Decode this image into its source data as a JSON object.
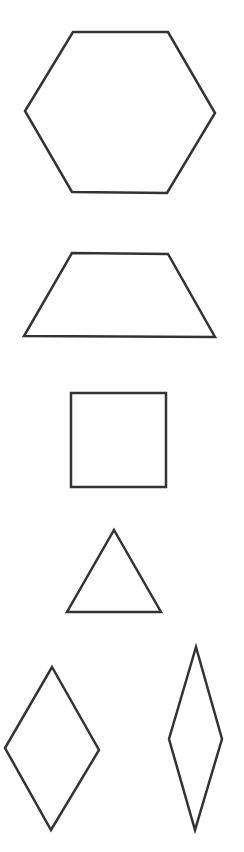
{
  "canvas": {
    "width": 244,
    "height": 852,
    "background": "#ffffff"
  },
  "style": {
    "stroke": "#333333",
    "stroke_width": 2.5,
    "fill": "#ffffff"
  },
  "shapes": [
    {
      "name": "hexagon",
      "points": "73,32 168,32 215,113 167,193 72,192 25,111"
    },
    {
      "name": "trapezoid",
      "points": "72,253 168,254 215,337 24,336"
    },
    {
      "name": "square",
      "points": "71,393 166,393 166,487 71,487"
    },
    {
      "name": "triangle",
      "points": "114,530 161,612 67,612"
    },
    {
      "name": "rhombus-wide",
      "points": "52,667 99,750 51,830 5,748"
    },
    {
      "name": "rhombus-thin",
      "points": "196,647 222,739 195,830 169,739"
    }
  ]
}
